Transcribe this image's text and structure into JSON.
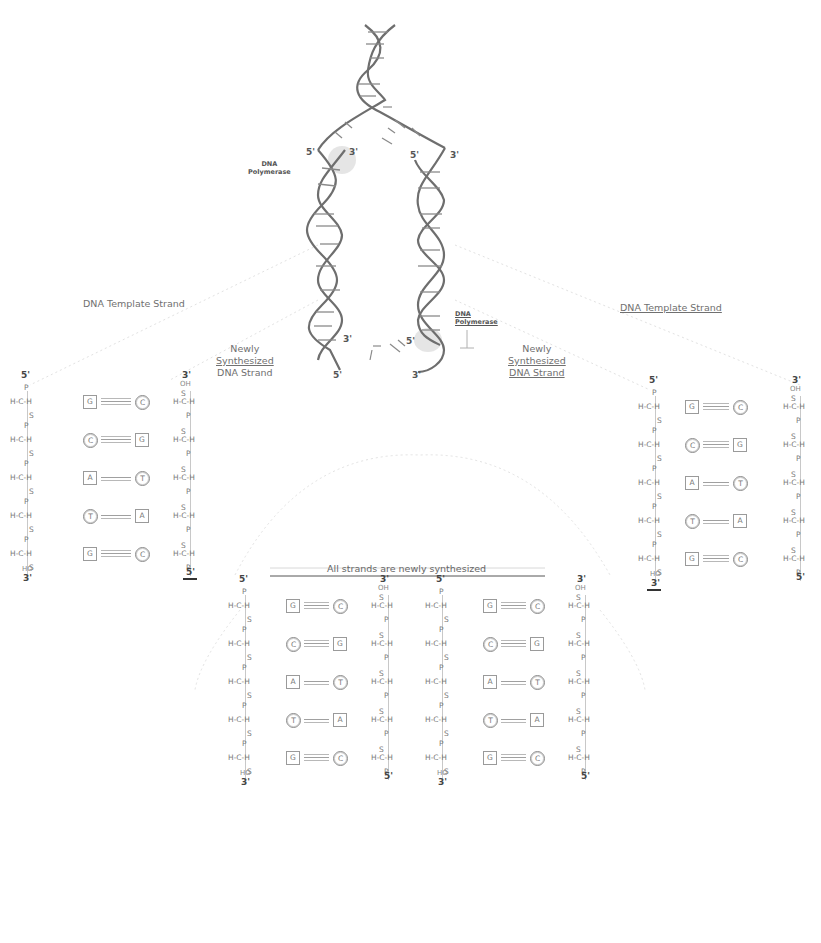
{
  "labels": {
    "template_left": "DNA Template Strand",
    "template_right": "DNA Template Strand",
    "new_left": [
      "Newly",
      "Synthesized",
      "DNA Strand"
    ],
    "new_right": [
      "Newly",
      "Synthesized",
      "DNA Strand"
    ],
    "polymerase_top": [
      "DNA",
      "Polymerase"
    ],
    "polymerase_bottom": [
      "DNA",
      "Polymerase"
    ],
    "all_new": "All strands are newly synthesized"
  },
  "helix_ends": {
    "left_top_5": "5'",
    "left_top_3": "3'",
    "right_top_5": "5'",
    "right_top_3": "3'",
    "left_bottom_3": "3'",
    "left_bottom_5": "5'",
    "right_bottom_5": "5'",
    "right_bottom_3": "3'"
  },
  "backbone": {
    "sugar_carbon": "H-C-H",
    "phosphate": "P",
    "sugar": "S",
    "hydroxyl_top": "OH",
    "hydroxyl_bottom": "HO",
    "five_prime": "5'",
    "three_prime": "3'"
  },
  "panels": [
    {
      "id": "left",
      "left_strand_label": "DNA Template Strand",
      "right_strand_label": "Newly Synthesized DNA Strand",
      "pairs": [
        {
          "left": "G",
          "left_shape": "square",
          "right": "C",
          "right_shape": "hexagon",
          "bond": "triple"
        },
        {
          "left": "C",
          "left_shape": "hexagon",
          "right": "G",
          "right_shape": "square",
          "bond": "triple"
        },
        {
          "left": "A",
          "left_shape": "square",
          "right": "T",
          "right_shape": "hexagon",
          "bond": "double"
        },
        {
          "left": "T",
          "left_shape": "hexagon",
          "right": "A",
          "right_shape": "square",
          "bond": "double"
        },
        {
          "left": "G",
          "left_shape": "square",
          "right": "C",
          "right_shape": "hexagon",
          "bond": "triple"
        }
      ],
      "top_left": "5'",
      "top_right": "3'",
      "bottom_left": "3'",
      "bottom_right": "5'"
    },
    {
      "id": "middle-a",
      "pairs": [
        {
          "left": "G",
          "left_shape": "square",
          "right": "C",
          "right_shape": "hexagon",
          "bond": "triple"
        },
        {
          "left": "C",
          "left_shape": "hexagon",
          "right": "G",
          "right_shape": "square",
          "bond": "triple"
        },
        {
          "left": "A",
          "left_shape": "square",
          "right": "T",
          "right_shape": "hexagon",
          "bond": "double"
        },
        {
          "left": "T",
          "left_shape": "hexagon",
          "right": "A",
          "right_shape": "square",
          "bond": "double"
        },
        {
          "left": "G",
          "left_shape": "square",
          "right": "C",
          "right_shape": "hexagon",
          "bond": "triple"
        }
      ],
      "top_left": "5'",
      "top_right": "3'",
      "bottom_left": "3'",
      "bottom_right": "5'"
    },
    {
      "id": "middle-b",
      "pairs": [
        {
          "left": "G",
          "left_shape": "square",
          "right": "C",
          "right_shape": "hexagon",
          "bond": "triple"
        },
        {
          "left": "C",
          "left_shape": "hexagon",
          "right": "G",
          "right_shape": "square",
          "bond": "triple"
        },
        {
          "left": "A",
          "left_shape": "square",
          "right": "T",
          "right_shape": "hexagon",
          "bond": "double"
        },
        {
          "left": "T",
          "left_shape": "hexagon",
          "right": "A",
          "right_shape": "square",
          "bond": "double"
        },
        {
          "left": "G",
          "left_shape": "square",
          "right": "C",
          "right_shape": "hexagon",
          "bond": "triple"
        }
      ],
      "top_left": "5'",
      "top_right": "3'",
      "bottom_left": "3'",
      "bottom_right": "5'"
    },
    {
      "id": "right",
      "left_strand_label": "Newly Synthesized DNA Strand",
      "right_strand_label": "DNA Template Strand",
      "pairs": [
        {
          "left": "G",
          "left_shape": "square",
          "right": "C",
          "right_shape": "hexagon",
          "bond": "triple"
        },
        {
          "left": "C",
          "left_shape": "hexagon",
          "right": "G",
          "right_shape": "square",
          "bond": "triple"
        },
        {
          "left": "A",
          "left_shape": "square",
          "right": "T",
          "right_shape": "hexagon",
          "bond": "double"
        },
        {
          "left": "T",
          "left_shape": "hexagon",
          "right": "A",
          "right_shape": "square",
          "bond": "double"
        },
        {
          "left": "G",
          "left_shape": "square",
          "right": "C",
          "right_shape": "hexagon",
          "bond": "triple"
        }
      ],
      "top_left": "5'",
      "top_right": "3'",
      "bottom_left": "3'",
      "bottom_right": "5'"
    }
  ],
  "colors": {
    "background": "#ffffff",
    "helix_strand": "#6e6e6e",
    "helix_rung": "#8a8a8a",
    "text": "#6a6a6a",
    "polymerase_glow": "#c9c9c9",
    "guide_lines": "#e0e0e0"
  }
}
